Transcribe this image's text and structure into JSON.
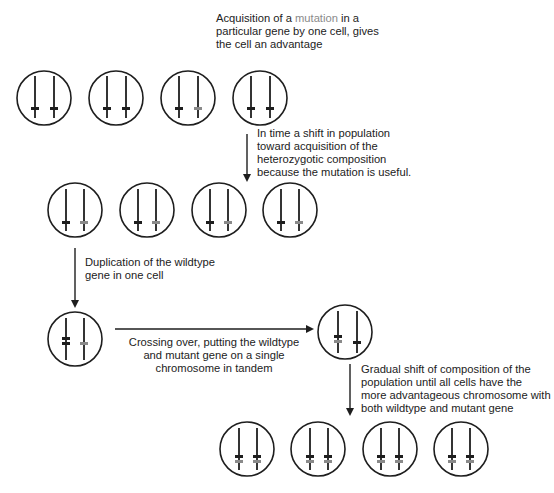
{
  "colors": {
    "ink": "#1e1e1e",
    "mutant": "#8a8a8a",
    "wildtype": "#1e1e1e",
    "background": "#ffffff"
  },
  "labels": {
    "step1": {
      "prefix": "Acquisition of a ",
      "highlight": "mutation",
      "line1_suffix": " in a",
      "line2": "particular gene by one cell, gives",
      "line3": "the cell an advantage"
    },
    "step2": {
      "line1": "In time a shift in population",
      "line2": "toward acquisition of the",
      "line3": "heterozygotic composition",
      "line4": "because the mutation is useful."
    },
    "step3": {
      "line1": "Duplication of the wildtype",
      "line2": "gene in one cell"
    },
    "step4": {
      "line1": "Crossing over, putting the wildtype",
      "line2": "and mutant gene on a single",
      "line3": "chromosome in tandem"
    },
    "step5": {
      "line1": "Gradual shift of composition of the",
      "line2": "population until all cells have the",
      "line3": "more advantageous chromosome with",
      "line4": "both wildtype and mutant gene"
    }
  },
  "rows": [
    {
      "name": "initial-population",
      "cells": [
        "wt/wt",
        "wt/wt",
        "wt/mut",
        "wt/wt"
      ]
    },
    {
      "name": "heterozygous-population",
      "cells": [
        "wt/mut",
        "wt/mut",
        "wt/mut",
        "wt/mut"
      ]
    },
    {
      "name": "duplication-cell",
      "cells": [
        "wt+wt/mut"
      ]
    },
    {
      "name": "crossover-cell",
      "cells": [
        "wt+mut/wt"
      ]
    },
    {
      "name": "final-population",
      "cells": [
        "wt+mut/wt+mut",
        "wt+mut/wt+mut",
        "wt+mut/wt+mut",
        "wt+mut/wt+mut"
      ]
    }
  ]
}
